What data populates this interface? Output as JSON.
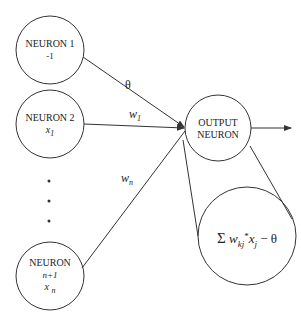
{
  "neurons": [
    {
      "name": "NEURON 1",
      "input": "-1"
    },
    {
      "name": "NEURON 2",
      "input": "x",
      "input_sub": "1"
    },
    {
      "name": "NEURON",
      "index": "n+1",
      "input": "x",
      "input_sub": "n"
    }
  ],
  "output_neuron": {
    "line1": "OUTPUT",
    "line2": "NEURON"
  },
  "weights": {
    "theta": "θ",
    "w1": "w",
    "w1_sub": "1",
    "wn": "w",
    "wn_sub": "n"
  },
  "formula": {
    "sigma": "Σ",
    "w": "w",
    "w_sub": "kj",
    "dot": "*",
    "x": "x",
    "x_sub": "j",
    "minus_theta": "− θ"
  },
  "ellipsis": "⋮"
}
